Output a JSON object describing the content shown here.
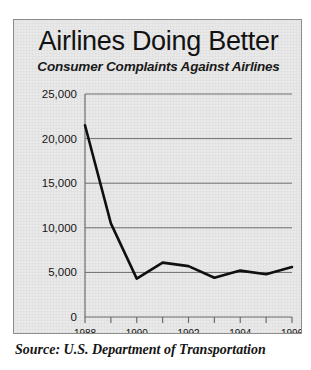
{
  "figure": {
    "title": "Airlines Doing Better",
    "subtitle": "Consumer Complaints Against Airlines",
    "source_note": "Source:  U.S. Department of Transportation",
    "panel_background": "#e9e9e9",
    "border_color": "#8d8d8d",
    "line_color": "#101010",
    "gridline_color": "#6f6f6f"
  },
  "chart_data": {
    "type": "line",
    "title": "Airlines Doing Better",
    "subtitle": "Consumer Complaints Against Airlines",
    "xlabel": "",
    "ylabel": "",
    "x": [
      1988,
      1989,
      1990,
      1991,
      1992,
      1993,
      1994,
      1995,
      1996
    ],
    "values": [
      21500,
      10500,
      4300,
      6100,
      5700,
      4400,
      5200,
      4800,
      5600
    ],
    "series": [
      {
        "name": "Consumer Complaints Against Airlines",
        "values": [
          21500,
          10500,
          4300,
          6100,
          5700,
          4400,
          5200,
          4800,
          5600
        ]
      }
    ],
    "xlim": [
      1988,
      1996
    ],
    "ylim": [
      0,
      25000
    ],
    "ytick_labels": [
      "25,000",
      "20,000",
      "15,000",
      "10,000",
      "5,000",
      "0"
    ],
    "ytick_values": [
      25000,
      20000,
      15000,
      10000,
      5000,
      0
    ],
    "xtick_values": [
      1988,
      1989,
      1990,
      1991,
      1992,
      1993,
      1994,
      1995,
      1996
    ],
    "xtick_labels_shown": [
      "1988",
      "1990",
      "1992",
      "1994",
      "1996"
    ],
    "xtick_labeled_values": [
      1988,
      1990,
      1992,
      1994,
      1996
    ],
    "grid": true,
    "grid_axis": "y",
    "legend": false,
    "legend_position": "none",
    "source": "Source:  U.S. Department of Transportation"
  }
}
